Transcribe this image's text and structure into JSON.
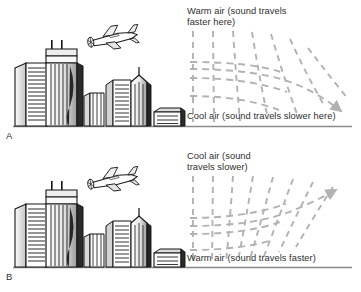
{
  "figure": {
    "colors": {
      "ray": "#b2b2b2",
      "ground": "#8a8a8a",
      "ink": "#1a1a1a",
      "text": "#2e2e2e",
      "background": "#ffffff"
    }
  },
  "panels": [
    {
      "letter": "A",
      "top_label": "Warm air (sound travels\nfaster here)",
      "bottom_label": "Cool air (sound travels slower here)",
      "ray_direction": "downward",
      "arrow_label": "sound ray bends downward toward the ground",
      "scene": {
        "airplane": "airplane-icon",
        "skyline": "city-skyline"
      }
    },
    {
      "letter": "B",
      "top_label": "Cool air (sound\ntravels slower)",
      "bottom_label": "Warm air (sound travels faster)",
      "ray_direction": "upward",
      "arrow_label": "sound ray bends upward away from the ground",
      "scene": {
        "airplane": "airplane-icon",
        "skyline": "city-skyline"
      }
    }
  ]
}
